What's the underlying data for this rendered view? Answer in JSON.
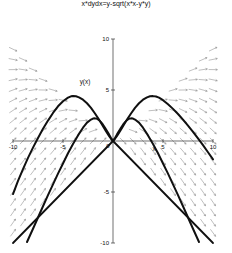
{
  "figure": {
    "title": "x*dydx=y-sqrt(x*x-y*y)",
    "ylabel": "y(x)",
    "xlabel": "x"
  },
  "chart_data": {
    "type": "line",
    "title": "x*dydx=y-sqrt(x*x-y*y)",
    "subtitle": "",
    "xlabel": "x",
    "ylabel": "y(x)",
    "xlim": [
      -10,
      10
    ],
    "ylim": [
      -10,
      10
    ],
    "grid": false,
    "legend": null,
    "xticks": [
      -10,
      -5,
      0,
      5,
      10
    ],
    "yticks": [
      -10,
      -5,
      0,
      5,
      10
    ],
    "xtick_labels": [
      "-10",
      "-5",
      "0",
      "5",
      "10"
    ],
    "ytick_labels": [
      "-10",
      "-5",
      "0",
      "5",
      "10"
    ],
    "annotations": [
      {
        "text": "y(x)",
        "x": -2.8,
        "y": 5.6
      },
      {
        "text": "x",
        "x": 4.1,
        "y": -0.95
      }
    ],
    "field": {
      "kind": "direction-field",
      "equation": "x*dy/dx = y - sqrt(x*x - y*y)",
      "domain_note": "arrows drawn only where |y| <= |x|",
      "grid_nx": 21,
      "grid_ny": 21,
      "color": "#8a8a8a"
    },
    "series": [
      {
        "name": "solution-upper-left",
        "comment": "arch through third-quadrant rising to peak near (-5.5, 4.3) then down to origin",
        "color": "#101010",
        "width": 2.0,
        "points": [
          [
            -10.0,
            -5.2
          ],
          [
            -9.5,
            -3.9
          ],
          [
            -9.0,
            -2.75
          ],
          [
            -8.5,
            -1.65
          ],
          [
            -8.0,
            -0.65
          ],
          [
            -7.5,
            0.3
          ],
          [
            -7.0,
            1.2
          ],
          [
            -6.5,
            2.0
          ],
          [
            -6.0,
            2.75
          ],
          [
            -5.5,
            3.4
          ],
          [
            -5.0,
            3.9
          ],
          [
            -4.5,
            4.25
          ],
          [
            -4.2,
            4.38
          ],
          [
            -4.0,
            4.4
          ],
          [
            -3.7,
            4.38
          ],
          [
            -3.4,
            4.28
          ],
          [
            -3.0,
            4.05
          ],
          [
            -2.6,
            3.7
          ],
          [
            -2.2,
            3.25
          ],
          [
            -1.8,
            2.7
          ],
          [
            -1.4,
            2.1
          ],
          [
            -1.0,
            1.45
          ],
          [
            -0.7,
            0.95
          ],
          [
            -0.4,
            0.5
          ],
          [
            -0.2,
            0.22
          ],
          [
            0.0,
            0.0
          ]
        ]
      },
      {
        "name": "solution-upper-right",
        "comment": "mirror arch rising from origin to peak near (5.0, 4.4) then falling",
        "color": "#101010",
        "width": 2.0,
        "points": [
          [
            0.0,
            0.0
          ],
          [
            0.2,
            0.22
          ],
          [
            0.4,
            0.5
          ],
          [
            0.7,
            0.95
          ],
          [
            1.0,
            1.45
          ],
          [
            1.4,
            2.1
          ],
          [
            1.8,
            2.7
          ],
          [
            2.2,
            3.25
          ],
          [
            2.6,
            3.7
          ],
          [
            3.0,
            4.05
          ],
          [
            3.4,
            4.28
          ],
          [
            3.7,
            4.38
          ],
          [
            4.0,
            4.4
          ],
          [
            4.3,
            4.36
          ],
          [
            4.6,
            4.25
          ],
          [
            5.0,
            4.0
          ],
          [
            5.5,
            3.6
          ],
          [
            6.0,
            3.15
          ],
          [
            6.5,
            2.65
          ],
          [
            7.0,
            2.1
          ],
          [
            7.5,
            1.5
          ],
          [
            8.0,
            0.9
          ],
          [
            8.5,
            0.25
          ],
          [
            9.0,
            -0.4
          ],
          [
            9.5,
            -1.1
          ],
          [
            10.0,
            -1.8
          ]
        ]
      },
      {
        "name": "solution-inner-left",
        "comment": "smaller arch peaking near (-3.0, 2.1), falls steeply into third quadrant",
        "color": "#101010",
        "width": 2.0,
        "points": [
          [
            -8.6,
            -9.9
          ],
          [
            -8.0,
            -8.6
          ],
          [
            -7.5,
            -7.5
          ],
          [
            -7.0,
            -6.4
          ],
          [
            -6.5,
            -5.3
          ],
          [
            -6.0,
            -4.25
          ],
          [
            -5.5,
            -3.2
          ],
          [
            -5.0,
            -2.2
          ],
          [
            -4.5,
            -1.2
          ],
          [
            -4.0,
            -0.3
          ],
          [
            -3.5,
            0.55
          ],
          [
            -3.0,
            1.3
          ],
          [
            -2.6,
            1.8
          ],
          [
            -2.2,
            2.1
          ],
          [
            -2.0,
            2.2
          ],
          [
            -1.8,
            2.22
          ],
          [
            -1.6,
            2.18
          ],
          [
            -1.4,
            2.05
          ],
          [
            -1.2,
            1.85
          ],
          [
            -1.0,
            1.6
          ],
          [
            -0.8,
            1.3
          ],
          [
            -0.6,
            0.98
          ],
          [
            -0.4,
            0.65
          ],
          [
            -0.2,
            0.3
          ],
          [
            0.0,
            0.0
          ]
        ]
      },
      {
        "name": "solution-inner-right",
        "comment": "mirror of inner-left: small arch peaking near (2.0, 2.2) then steep drop",
        "color": "#101010",
        "width": 2.0,
        "points": [
          [
            0.0,
            0.0
          ],
          [
            0.2,
            0.3
          ],
          [
            0.4,
            0.65
          ],
          [
            0.6,
            0.98
          ],
          [
            0.8,
            1.3
          ],
          [
            1.0,
            1.6
          ],
          [
            1.2,
            1.85
          ],
          [
            1.4,
            2.05
          ],
          [
            1.6,
            2.18
          ],
          [
            1.8,
            2.22
          ],
          [
            2.0,
            2.2
          ],
          [
            2.2,
            2.1
          ],
          [
            2.6,
            1.8
          ],
          [
            3.0,
            1.3
          ],
          [
            3.5,
            0.55
          ],
          [
            4.0,
            -0.3
          ],
          [
            4.5,
            -1.2
          ],
          [
            5.0,
            -2.2
          ],
          [
            5.5,
            -3.2
          ],
          [
            6.0,
            -4.25
          ],
          [
            6.5,
            -5.3
          ],
          [
            7.0,
            -6.4
          ],
          [
            7.5,
            -7.5
          ],
          [
            8.0,
            -8.6
          ],
          [
            8.6,
            -9.9
          ]
        ]
      },
      {
        "name": "asymptote-line-negative",
        "comment": "straight boundary line y = x through origin (lower-left branch)",
        "color": "#101010",
        "width": 1.8,
        "points": [
          [
            -10.0,
            -10.0
          ],
          [
            0.0,
            0.0
          ]
        ]
      },
      {
        "name": "asymptote-line-positive",
        "comment": "straight boundary line y = -x through origin (lower-right branch)",
        "color": "#101010",
        "width": 1.8,
        "points": [
          [
            0.0,
            0.0
          ],
          [
            10.0,
            -10.0
          ]
        ]
      }
    ]
  }
}
